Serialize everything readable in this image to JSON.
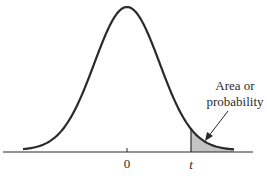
{
  "figure": {
    "type": "t-distribution curve with shaded right tail",
    "axis": {
      "center_label": "0",
      "critical_label": "t"
    },
    "annotation": {
      "line1": "Area or",
      "line2": "probability"
    },
    "colors": {
      "curve": "#2a2a2a",
      "shade": "#c4c4c4",
      "axis": "#2a2a2a",
      "background": "#ffffff"
    }
  }
}
